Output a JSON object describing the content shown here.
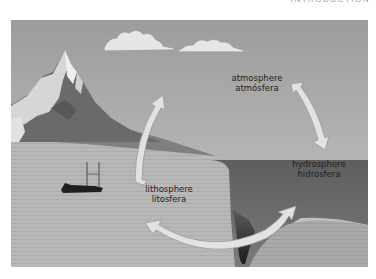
{
  "page": {
    "header_text": "INTRODUCTION"
  },
  "figure": {
    "labels": {
      "atmosphere": {
        "en": "atmosphere",
        "es": "atmósfera"
      },
      "hydrosphere": {
        "en": "hydrosphere",
        "es": "hidrosfera"
      },
      "lithosphere": {
        "en": "lithosphere",
        "es": "litosfera"
      }
    },
    "elements": [
      "mountain",
      "clouds",
      "boat",
      "ocean",
      "land",
      "ocean-trench",
      "cycle-arrows"
    ],
    "colors": {
      "sky": "#a8a8a8",
      "land": "#bdbdbd",
      "ocean": "#6e6e6e",
      "arrow_fill": "#e2e2e2",
      "arrow_stroke": "#9a9a9a",
      "text": "#1e1e1e"
    }
  }
}
